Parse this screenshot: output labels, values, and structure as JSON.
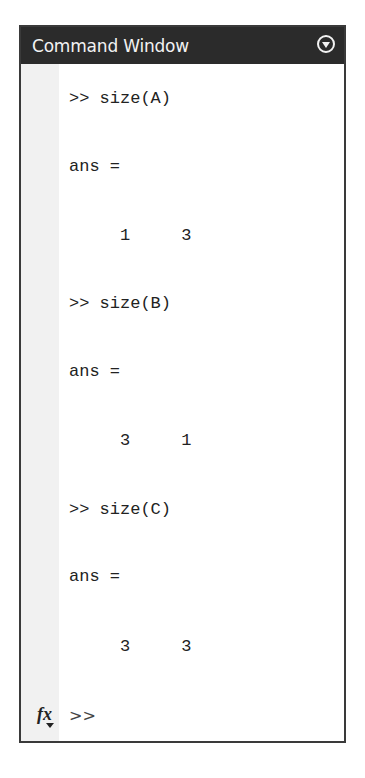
{
  "window": {
    "title": "Command Window",
    "menu_icon": "circle-chevron-down-icon"
  },
  "history": [
    {
      "type": "command",
      "text": ">> size(A)"
    },
    {
      "type": "output_label",
      "text": "ans ="
    },
    {
      "type": "output_values",
      "text": "     1     3"
    },
    {
      "type": "command",
      "text": ">> size(B)"
    },
    {
      "type": "output_label",
      "text": "ans ="
    },
    {
      "type": "output_values",
      "text": "     3     1"
    },
    {
      "type": "command",
      "text": ">> size(C)"
    },
    {
      "type": "output_label",
      "text": "ans ="
    },
    {
      "type": "output_values",
      "text": "     3     3"
    }
  ],
  "prompt": {
    "fx_label": "fx",
    "prompt_text": ">>"
  }
}
